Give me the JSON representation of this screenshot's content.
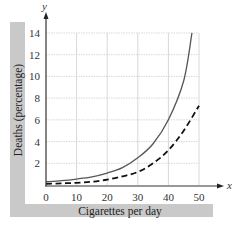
{
  "chart_data": {
    "type": "line",
    "title": "",
    "xlabel": "Cigarettes per day",
    "ylabel": "Deaths (percentage)",
    "x_axis_symbol": "x",
    "y_axis_symbol": "y",
    "xlim": [
      0,
      50
    ],
    "ylim": [
      0,
      14
    ],
    "xticks": [
      0,
      10,
      20,
      30,
      40,
      50
    ],
    "yticks": [
      2,
      4,
      6,
      8,
      10,
      12,
      14
    ],
    "grid": true,
    "legend": null,
    "series": [
      {
        "name": "solid curve",
        "style": "solid",
        "color": "#555555",
        "x": [
          0,
          5,
          10,
          15,
          20,
          25,
          30,
          35,
          40,
          45,
          47.7
        ],
        "y": [
          0.3,
          0.4,
          0.55,
          0.75,
          1.1,
          1.6,
          2.5,
          3.8,
          6.0,
          9.6,
          14.0
        ]
      },
      {
        "name": "dashed curve",
        "style": "dashed",
        "color": "#111111",
        "x": [
          0,
          5,
          10,
          15,
          20,
          25,
          30,
          35,
          40,
          45,
          50
        ],
        "y": [
          0.1,
          0.15,
          0.2,
          0.3,
          0.5,
          0.8,
          1.2,
          2.0,
          3.2,
          5.0,
          7.3
        ]
      }
    ]
  },
  "colors": {
    "band": "#c9c9c9",
    "grid": "#d8d8d8",
    "axis": "#333333"
  }
}
